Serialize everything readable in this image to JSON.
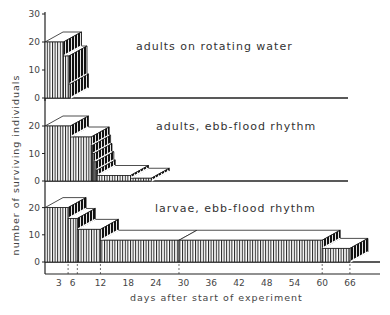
{
  "chart_data": {
    "type": "bar",
    "style": "3D step histogram (survivorship curves)",
    "xlabel": "days after start of experiment",
    "ylabel": "number of surviving individuals",
    "x_ticks": [
      3,
      6,
      12,
      18,
      24,
      30,
      36,
      42,
      48,
      54,
      60,
      66
    ],
    "y_ticks_top": [
      0,
      10,
      20,
      30
    ],
    "y_ticks": [
      0,
      10,
      20
    ],
    "xlim": [
      0,
      72
    ],
    "grid": false,
    "panels": [
      {
        "title": "adults on rotating water",
        "ylim": [
          0,
          30
        ],
        "steps": [
          {
            "start": 0,
            "end": 4,
            "value": 20
          },
          {
            "start": 4,
            "end": 5.2,
            "value": 15
          },
          {
            "start": 5.2,
            "end": 5.5,
            "value": 5
          }
        ],
        "dashed_days": [
          4
        ]
      },
      {
        "title": "adults, ebb-flood rhythm",
        "ylim": [
          0,
          20
        ],
        "steps": [
          {
            "start": 0,
            "end": 5.5,
            "value": 20
          },
          {
            "start": 5.5,
            "end": 10,
            "value": 16
          },
          {
            "start": 10,
            "end": 10.3,
            "value": 13
          },
          {
            "start": 10.3,
            "end": 10.6,
            "value": 10
          },
          {
            "start": 10.6,
            "end": 11,
            "value": 7
          },
          {
            "start": 11,
            "end": 11.3,
            "value": 4
          },
          {
            "start": 11.3,
            "end": 18.5,
            "value": 2
          },
          {
            "start": 18.5,
            "end": 23,
            "value": 1
          }
        ],
        "dashed_days": [
          10,
          18.5
        ]
      },
      {
        "title": "larvae, ebb-flood rhythm",
        "ylim": [
          0,
          20
        ],
        "steps": [
          {
            "start": 0,
            "end": 5,
            "value": 20
          },
          {
            "start": 5,
            "end": 7,
            "value": 16
          },
          {
            "start": 7,
            "end": 12,
            "value": 12
          },
          {
            "start": 12,
            "end": 29,
            "value": 8
          },
          {
            "start": 29,
            "end": 60,
            "value": 8
          },
          {
            "start": 60,
            "end": 66,
            "value": 5
          }
        ],
        "dashed_days": [
          5,
          7,
          12,
          29,
          60,
          66
        ]
      }
    ]
  },
  "labels": {
    "xlabel": "days after start of experiment",
    "ylabel": "number of surviving individuals",
    "panel_titles": [
      "adults on rotating water",
      "adults, ebb-flood rhythm",
      "larvae, ebb-flood rhythm"
    ]
  }
}
